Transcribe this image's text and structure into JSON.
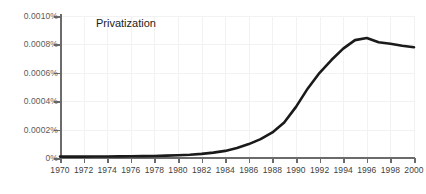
{
  "chart_data": {
    "type": "line",
    "title": "Privatization",
    "xlabel": "",
    "ylabel": "",
    "grid": true,
    "legend_position": "none",
    "xlim": [
      1970,
      2000
    ],
    "ylim": [
      0,
      0.001
    ],
    "y_tick_labels": [
      "0%",
      "0.0002%",
      "0.0004%",
      "0.0006%",
      "0.0008%",
      "0.0010%"
    ],
    "y_tick_values": [
      0,
      0.0002,
      0.0004,
      0.0006,
      0.0008,
      0.001
    ],
    "x_tick_labels": [
      "1970",
      "1972",
      "1974",
      "1976",
      "1978",
      "1980",
      "1982",
      "1984",
      "1986",
      "1988",
      "1990",
      "1992",
      "1994",
      "1996",
      "1998",
      "2000"
    ],
    "x_tick_values": [
      1970,
      1972,
      1974,
      1976,
      1978,
      1980,
      1982,
      1984,
      1986,
      1988,
      1990,
      1992,
      1994,
      1996,
      1998,
      2000
    ],
    "series": [
      {
        "name": "Privatization",
        "color": "#1a1a1a",
        "x": [
          1970,
          1971,
          1972,
          1973,
          1974,
          1975,
          1976,
          1977,
          1978,
          1979,
          1980,
          1981,
          1982,
          1983,
          1984,
          1985,
          1986,
          1987,
          1988,
          1989,
          1990,
          1991,
          1992,
          1993,
          1994,
          1995,
          1996,
          1997,
          1998,
          1999,
          2000
        ],
        "values": [
          1e-05,
          1e-05,
          1e-05,
          1.05e-05,
          1.1e-05,
          1.15e-05,
          1.2e-05,
          1.3e-05,
          1.45e-05,
          1.65e-05,
          1.9e-05,
          2.3e-05,
          2.9e-05,
          3.8e-05,
          5e-05,
          7e-05,
          9.8e-05,
          0.000133,
          0.00018,
          0.00025,
          0.00036,
          0.00049,
          0.0006,
          0.00069,
          0.00077,
          0.00083,
          0.000845,
          0.000815,
          0.000805,
          0.00079,
          0.00078
        ]
      }
    ]
  }
}
